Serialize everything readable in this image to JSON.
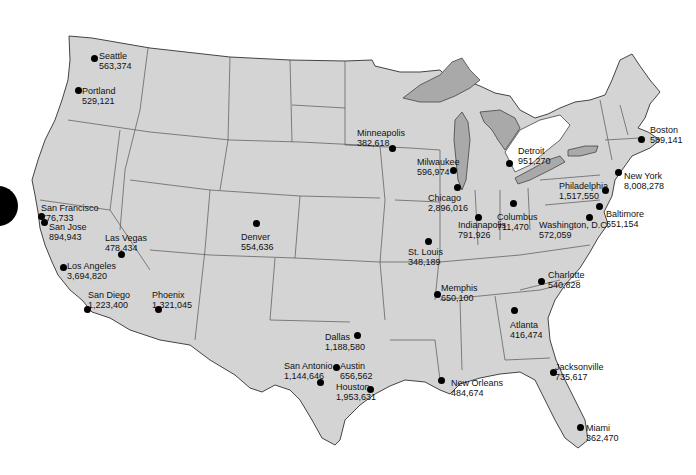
{
  "map": {
    "land_color": "#d4d4d4",
    "lake_color": "#a9a9a9",
    "border_color": "#555555",
    "dot_color": "#000000"
  },
  "cities": [
    {
      "name": "Seattle",
      "population": "563,374",
      "dot": [
        94,
        58
      ],
      "label": [
        99,
        51
      ]
    },
    {
      "name": "Portland",
      "population": "529,121",
      "dot": [
        78,
        90
      ],
      "label": [
        82,
        86
      ]
    },
    {
      "name": "San Francisco",
      "population": "776,733",
      "dot": [
        41,
        216
      ],
      "label": [
        41,
        203
      ]
    },
    {
      "name": "San Jose",
      "population": "894,943",
      "dot": [
        44,
        222
      ],
      "label": [
        49,
        222
      ]
    },
    {
      "name": "Las Vegas",
      "population": "478,434",
      "dot": [
        121,
        254
      ],
      "label": [
        105,
        233
      ]
    },
    {
      "name": "Los Angeles",
      "population": "3,694,820",
      "dot": [
        63,
        267
      ],
      "label": [
        67,
        261
      ]
    },
    {
      "name": "San Diego",
      "population": "1,223,400",
      "dot": [
        87,
        309
      ],
      "label": [
        88,
        290
      ]
    },
    {
      "name": "Phoenix",
      "population": "1,321,045",
      "dot": [
        158,
        309
      ],
      "label": [
        152,
        290
      ]
    },
    {
      "name": "Denver",
      "population": "554,636",
      "dot": [
        256,
        223
      ],
      "label": [
        241,
        232
      ]
    },
    {
      "name": "Minneapolis",
      "population": "382,618",
      "dot": [
        392,
        148
      ],
      "label": [
        357,
        128
      ]
    },
    {
      "name": "Milwaukee",
      "population": "596,974",
      "dot": [
        453,
        170
      ],
      "label": [
        417,
        157
      ]
    },
    {
      "name": "Chicago",
      "population": "2,896,016",
      "dot": [
        457,
        187
      ],
      "label": [
        428,
        193
      ]
    },
    {
      "name": "Detroit",
      "population": "951,270",
      "dot": [
        509,
        163
      ],
      "label": [
        518,
        146
      ]
    },
    {
      "name": "Indianapolis",
      "population": "791,926",
      "dot": [
        478,
        217
      ],
      "label": [
        458,
        220
      ]
    },
    {
      "name": "Columbus",
      "population": "711,470",
      "dot": [
        513,
        203
      ],
      "label": [
        497,
        212
      ]
    },
    {
      "name": "St. Louis",
      "population": "348,189",
      "dot": [
        428,
        241
      ],
      "label": [
        408,
        247
      ]
    },
    {
      "name": "Boston",
      "population": "589,141",
      "dot": [
        641,
        139
      ],
      "label": [
        650,
        125
      ]
    },
    {
      "name": "New York",
      "population": "8,008,278",
      "dot": [
        618,
        172
      ],
      "label": [
        624,
        171
      ]
    },
    {
      "name": "Philadelphia",
      "population": "1,517,550",
      "dot": [
        605,
        190
      ],
      "label": [
        559,
        181
      ]
    },
    {
      "name": "Baltimore",
      "population": "651,154",
      "dot": [
        599,
        206
      ],
      "label": [
        606,
        209
      ]
    },
    {
      "name": "Washington, D.C.",
      "population": "572,059",
      "dot": [
        589,
        217
      ],
      "label": [
        539,
        220
      ]
    },
    {
      "name": "Charlotte",
      "population": "540,828",
      "dot": [
        541,
        281
      ],
      "label": [
        548,
        270
      ]
    },
    {
      "name": "Memphis",
      "population": "650,100",
      "dot": [
        437,
        294
      ],
      "label": [
        441,
        283
      ]
    },
    {
      "name": "Atlanta",
      "population": "416,474",
      "dot": [
        514,
        310
      ],
      "label": [
        510,
        320
      ]
    },
    {
      "name": "Dallas",
      "population": "1,188,580",
      "dot": [
        357,
        335
      ],
      "label": [
        325,
        332
      ]
    },
    {
      "name": "Austin",
      "population": "656,562",
      "dot": [
        336,
        367
      ],
      "label": [
        340,
        361
      ]
    },
    {
      "name": "San Antonio",
      "population": "1,144,646",
      "dot": [
        320,
        382
      ],
      "label": [
        284,
        361
      ]
    },
    {
      "name": "Houston",
      "population": "1,953,631",
      "dot": [
        370,
        389
      ],
      "label": [
        336,
        382
      ]
    },
    {
      "name": "New Orleans",
      "population": "484,674",
      "dot": [
        441,
        380
      ],
      "label": [
        451,
        378
      ]
    },
    {
      "name": "Jacksonville",
      "population": "735,617",
      "dot": [
        553,
        372
      ],
      "label": [
        555,
        362
      ]
    },
    {
      "name": "Miami",
      "population": "362,470",
      "dot": [
        580,
        427
      ],
      "label": [
        586,
        423
      ]
    }
  ]
}
